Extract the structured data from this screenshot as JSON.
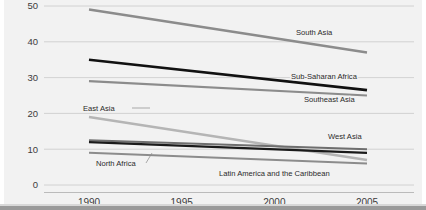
{
  "chart_data": {
    "type": "line",
    "title": "",
    "xlabel": "",
    "ylabel": "",
    "x": [
      1990,
      1995,
      2000,
      2005
    ],
    "xticklabels": [
      "1990",
      "1995",
      "2000",
      "2005"
    ],
    "yticklabels": [
      "0",
      "10",
      "20",
      "30",
      "40",
      "50"
    ],
    "yticks": [
      0,
      10,
      20,
      30,
      40,
      50
    ],
    "ylim": [
      0,
      52
    ],
    "xlim": [
      1989,
      2006
    ],
    "grid": "horizontal",
    "legend": "inline-labels",
    "series": [
      {
        "name": "South Asia",
        "color": "#8c8c8c",
        "width": 2.6,
        "x": [
          1990,
          2005
        ],
        "values": [
          49,
          37
        ]
      },
      {
        "name": "Sub-Saharan Africa",
        "color": "#111111",
        "width": 2.6,
        "x": [
          1990,
          2005
        ],
        "values": [
          35,
          26.5
        ]
      },
      {
        "name": "Southeast Asia",
        "color": "#8c8c8c",
        "width": 2.2,
        "x": [
          1990,
          2005
        ],
        "values": [
          29,
          25
        ]
      },
      {
        "name": "East Asia",
        "color": "#b5b5b5",
        "width": 2.4,
        "x": [
          1990,
          2005
        ],
        "values": [
          19,
          7
        ]
      },
      {
        "name": "West Asia",
        "color": "#6e6e6e",
        "width": 2.0,
        "x": [
          1990,
          2005
        ],
        "values": [
          12.5,
          10
        ]
      },
      {
        "name": "North Africa",
        "color": "#1a1a1a",
        "width": 2.2,
        "x": [
          1990,
          2005
        ],
        "values": [
          12,
          9
        ]
      },
      {
        "name": "Latin America and the Caribbean",
        "color": "#8c8c8c",
        "width": 2.0,
        "x": [
          1990,
          2005
        ],
        "values": [
          9,
          6
        ]
      }
    ],
    "annotations": [
      {
        "text": "South Asia",
        "x": 296,
        "y": 35,
        "anchor": "start",
        "leader": false
      },
      {
        "text": "Sub-Saharan Africa",
        "x": 291,
        "y": 79,
        "anchor": "start",
        "leader": false
      },
      {
        "text": "Southeast Asia",
        "x": 304,
        "y": 102,
        "anchor": "start",
        "leader": false
      },
      {
        "text": "East Asia",
        "x": 83,
        "y": 111,
        "anchor": "start",
        "leader": true,
        "leader_path": "M 132 108 L 150 108"
      },
      {
        "text": "West Asia",
        "x": 328,
        "y": 139,
        "anchor": "start",
        "leader": false
      },
      {
        "text": "North Africa",
        "x": 96,
        "y": 166,
        "anchor": "start",
        "leader": true,
        "leader_path": "M 146 163 L 152 153"
      },
      {
        "text": "Latin America and the Caribbean",
        "x": 219,
        "y": 176,
        "anchor": "start",
        "leader": false
      }
    ],
    "colors": {
      "background": "#f2f2f2",
      "grid": "#c9c9c9",
      "axis": "#b4b4b4",
      "text": "#3c3c3c",
      "footer_bar": "#9a9a9a"
    }
  }
}
